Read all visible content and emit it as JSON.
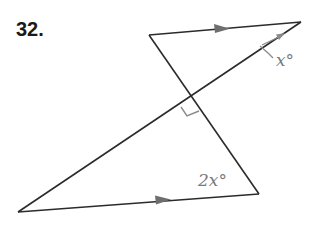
{
  "problem": {
    "number": "32."
  },
  "figure": {
    "type": "two triangles sharing a crossing transversal with parallel sides",
    "vertices": {
      "top_left": [
        149,
        35
      ],
      "top_right": [
        301,
        22
      ],
      "bottom_right": [
        259,
        194
      ],
      "bottom_left": [
        18,
        212
      ],
      "intersection": [
        192,
        99
      ]
    },
    "labels": {
      "top_angle": "x°",
      "bottom_angle": "2x°"
    },
    "markers": {
      "parallel_arrows": 2,
      "right_angle_at_intersection": true
    },
    "colors": {
      "line": "#2b2b2b",
      "label": "#7a7a7a",
      "marker": "#8a8a8a"
    }
  }
}
